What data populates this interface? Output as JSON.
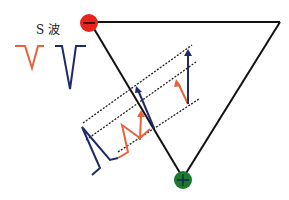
{
  "labels": {
    "s_wave": "S 波"
  },
  "colors": {
    "negative_electrode": "#e8231c",
    "positive_electrode": "#1a7a2a",
    "triangle": "#111111",
    "blue_wave": "#1f2a6b",
    "orange_wave": "#e8623a",
    "dotted": "#222222"
  },
  "electrodes": [
    {
      "name": "negative",
      "symbol": "−"
    },
    {
      "name": "positive",
      "symbol": "+"
    }
  ]
}
